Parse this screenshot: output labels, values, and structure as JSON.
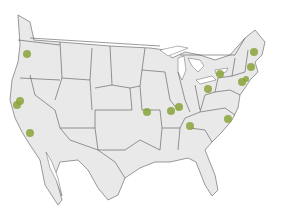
{
  "map": {
    "region": "North America (Contiguous United States)",
    "style": {
      "land_color": "#e9e9e9",
      "border_color": "#5a5a5a",
      "water_color": "#ffffff",
      "marker_color": "#8aa33a"
    },
    "markers": [
      {
        "id": "portland-or",
        "x": 27,
        "y": 54,
        "r": 4
      },
      {
        "id": "sf-bay-1",
        "x": 20,
        "y": 101,
        "r": 4
      },
      {
        "id": "sf-bay-2",
        "x": 17,
        "y": 105,
        "r": 4
      },
      {
        "id": "los-angeles",
        "x": 30,
        "y": 133,
        "r": 4
      },
      {
        "id": "kansas-city",
        "x": 147,
        "y": 112,
        "r": 4
      },
      {
        "id": "st-louis-1",
        "x": 171,
        "y": 111,
        "r": 4
      },
      {
        "id": "st-louis-2",
        "x": 179,
        "y": 107,
        "r": 4
      },
      {
        "id": "nashville",
        "x": 190,
        "y": 126,
        "r": 4
      },
      {
        "id": "raleigh",
        "x": 228,
        "y": 119,
        "r": 4
      },
      {
        "id": "pittsburgh",
        "x": 208,
        "y": 89,
        "r": 4
      },
      {
        "id": "buffalo",
        "x": 220,
        "y": 74,
        "r": 4
      },
      {
        "id": "new-york-1",
        "x": 242,
        "y": 82,
        "r": 4
      },
      {
        "id": "new-york-2",
        "x": 246,
        "y": 79,
        "r": 3
      },
      {
        "id": "boston",
        "x": 251,
        "y": 67,
        "r": 4
      },
      {
        "id": "portland-me",
        "x": 254,
        "y": 52,
        "r": 4
      }
    ]
  }
}
